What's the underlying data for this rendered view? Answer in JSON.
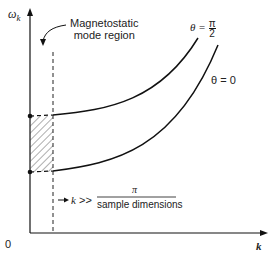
{
  "figure": {
    "y_axis_label": "ω",
    "y_axis_subscript": "k",
    "x_axis_label": "k",
    "origin_label": "0",
    "annotation_region_line1": "Magnetostatic",
    "annotation_region_line2": "mode region",
    "curve_upper_label_theta": "θ =",
    "curve_upper_label_num": "π",
    "curve_upper_label_den": "2",
    "curve_lower_label": "θ = 0",
    "condition_k": "k",
    "condition_op": ">>",
    "condition_num": "π",
    "condition_den": "sample dimensions"
  }
}
